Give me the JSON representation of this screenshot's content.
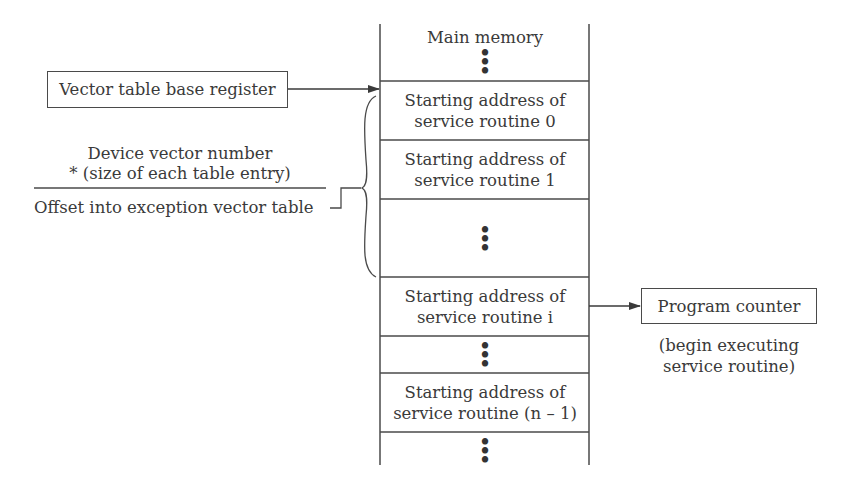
{
  "memory": {
    "title": "Main memory",
    "entries": [
      {
        "line1": "Starting address of",
        "line2": "service routine 0"
      },
      {
        "line1": "Starting address of",
        "line2": "service routine 1"
      },
      {
        "line1": "Starting address of",
        "line2": "service routine i"
      },
      {
        "line1": "Starting address of",
        "line2": "service routine (n – 1)"
      }
    ],
    "ellipsis": "•\n•\n•"
  },
  "vector_base_register": {
    "label": "Vector table base register"
  },
  "offset_calc": {
    "numerator_line1": "Device vector number",
    "numerator_line2": "* (size of each table entry)",
    "result": "Offset into exception vector table"
  },
  "program_counter": {
    "label": "Program counter",
    "note_line1": "(begin executing",
    "note_line2": "service routine)"
  },
  "colors": {
    "line": "#4a4a4a",
    "text": "#3a3a3a",
    "background": "#ffffff"
  }
}
